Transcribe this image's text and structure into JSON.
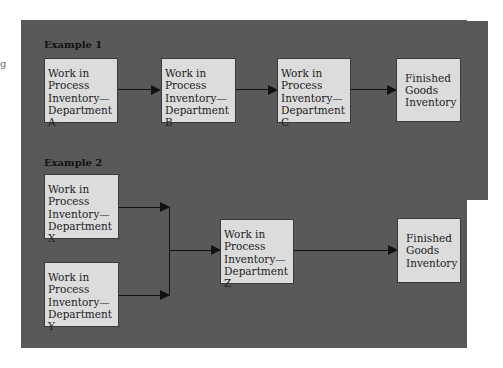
{
  "margin_mark": "g",
  "example1": {
    "label": "Example 1",
    "boxes": [
      {
        "text": "Work in\nProcess\nInventory—\nDepartment A"
      },
      {
        "text": "Work in\nProcess\nInventory—\nDepartment B"
      },
      {
        "text": "Work in\nProcess\nInventory—\nDepartment C"
      },
      {
        "text": "Finished\nGoods\nInventory"
      }
    ]
  },
  "example2": {
    "label": "Example 2",
    "boxes": [
      {
        "text": "Work in\nProcess\nInventory—\nDepartment X"
      },
      {
        "text": "Work in\nProcess\nInventory—\nDepartment Y"
      },
      {
        "text": "Work in\nProcess\nInventory—\nDepartment Z"
      },
      {
        "text": "Finished\nGoods\nInventory"
      }
    ]
  },
  "colors": {
    "panel_background": "#595959",
    "box_fill": "#dcdcdc",
    "arrow": "#111111"
  }
}
